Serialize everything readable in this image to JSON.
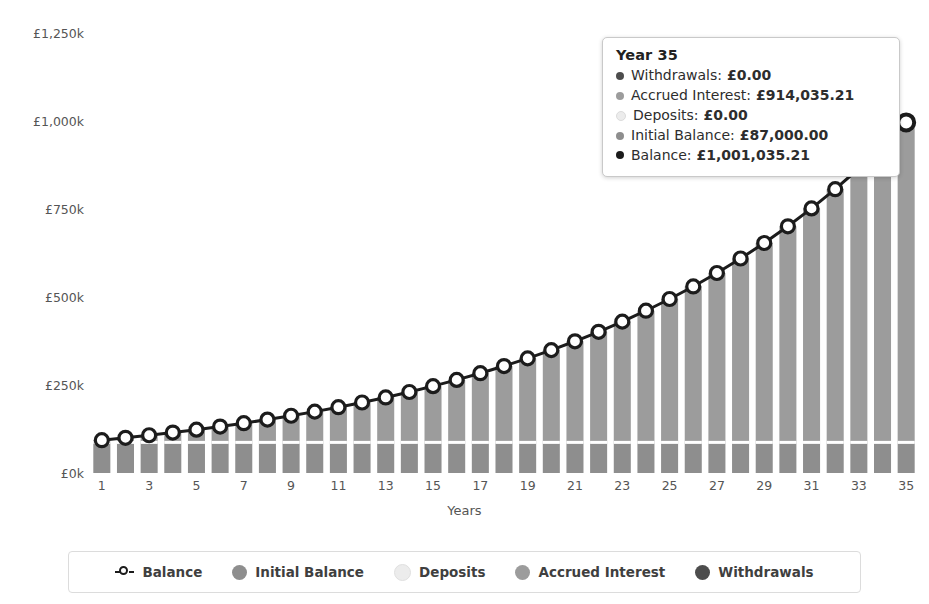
{
  "title": "",
  "chart_data": {
    "type": "bar",
    "subtype": "stacked-bar-with-line-overlay",
    "title": "",
    "xlabel": "Years",
    "ylabel": "",
    "xtick_step": 2,
    "grid": false,
    "legend_position": "bottom",
    "ylim": [
      0,
      1250000
    ],
    "ytick_values": [
      0,
      250000,
      500000,
      750000,
      1000000,
      1250000
    ],
    "ytick_labels": [
      "£0k",
      "£250k",
      "£500k",
      "£750k",
      "£1,000k",
      "£1,250k"
    ],
    "categories": [
      1,
      2,
      3,
      4,
      5,
      6,
      7,
      8,
      9,
      10,
      11,
      12,
      13,
      14,
      15,
      16,
      17,
      18,
      19,
      20,
      21,
      22,
      23,
      24,
      25,
      26,
      27,
      28,
      29,
      30,
      31,
      32,
      33,
      34,
      35
    ],
    "xtick_labels": [
      "1",
      "3",
      "5",
      "7",
      "9",
      "11",
      "13",
      "15",
      "17",
      "19",
      "21",
      "23",
      "25",
      "27",
      "29",
      "31",
      "33",
      "35"
    ],
    "series": [
      {
        "name": "Initial Balance",
        "kind": "bar",
        "color": "#8e8e8e",
        "values": [
          87000,
          87000,
          87000,
          87000,
          87000,
          87000,
          87000,
          87000,
          87000,
          87000,
          87000,
          87000,
          87000,
          87000,
          87000,
          87000,
          87000,
          87000,
          87000,
          87000,
          87000,
          87000,
          87000,
          87000,
          87000,
          87000,
          87000,
          87000,
          87000,
          87000,
          87000,
          87000,
          87000,
          87000,
          87000
        ]
      },
      {
        "name": "Deposits",
        "kind": "bar",
        "color": "#ececec",
        "values": [
          0,
          0,
          0,
          0,
          0,
          0,
          0,
          0,
          0,
          0,
          0,
          0,
          0,
          0,
          0,
          0,
          0,
          0,
          0,
          0,
          0,
          0,
          0,
          0,
          0,
          0,
          0,
          0,
          0,
          0,
          0,
          0,
          0,
          0,
          0
        ]
      },
      {
        "name": "Accrued Interest",
        "kind": "bar",
        "color": "#9c9c9c",
        "values": [
          6264,
          12978,
          20174,
          27888,
          36156,
          45019,
          54520,
          64703,
          75620,
          87321,
          99865,
          113309,
          127719,
          143163,
          159714,
          177453,
          196464,
          216841,
          238685,
          262103,
          287214,
          314143,
          343027,
          374012,
          407257,
          442930,
          481217,
          522313,
          566434,
          613809,
          664687,
          719337,
          778048,
          841136,
          908938
        ]
      },
      {
        "name": "Withdrawals",
        "kind": "bar",
        "color": "#4d4d4d",
        "values": [
          0,
          0,
          0,
          0,
          0,
          0,
          0,
          0,
          0,
          0,
          0,
          0,
          0,
          0,
          0,
          0,
          0,
          0,
          0,
          0,
          0,
          0,
          0,
          0,
          0,
          0,
          0,
          0,
          0,
          0,
          0,
          0,
          0,
          0,
          0
        ]
      },
      {
        "name": "Balance",
        "kind": "line",
        "color": "#1c1c1c",
        "marker": "open-circle",
        "values": [
          93264,
          99978,
          107174,
          114888,
          123156,
          132019,
          141520,
          151703,
          162620,
          174321,
          186865,
          200309,
          214719,
          230163,
          246714,
          264453,
          283464,
          303841,
          325685,
          349103,
          374214,
          401143,
          430027,
          461012,
          494257,
          529930,
          568217,
          609313,
          653434,
          700809,
          751687,
          806337,
          865048,
          928136,
          995938
        ]
      }
    ],
    "annotation_point": {
      "x": 35,
      "y": 1001035.21
    }
  },
  "yaxis": {
    "ticks": [
      {
        "label": "£1,250k",
        "value": 1250000
      },
      {
        "label": "£1,000k",
        "value": 1000000
      },
      {
        "label": "£750k",
        "value": 750000
      },
      {
        "label": "£500k",
        "value": 500000
      },
      {
        "label": "£250k",
        "value": 250000
      },
      {
        "label": "£0k",
        "value": 0
      }
    ]
  },
  "xaxis": {
    "title": "Years",
    "ticks": [
      "1",
      "3",
      "5",
      "7",
      "9",
      "11",
      "13",
      "15",
      "17",
      "19",
      "21",
      "23",
      "25",
      "27",
      "29",
      "31",
      "33",
      "35"
    ]
  },
  "tooltip": {
    "title": "Year 35",
    "rows": [
      {
        "name": "Withdrawals:",
        "value": "£0.00",
        "color": "#4d4d4d"
      },
      {
        "name": "Accrued Interest:",
        "value": "£914,035.21",
        "color": "#9c9c9c"
      },
      {
        "name": "Deposits:",
        "value": "£0.00",
        "color": "#ececec"
      },
      {
        "name": "Initial Balance:",
        "value": "£87,000.00",
        "color": "#8e8e8e"
      },
      {
        "name": "Balance:",
        "value": "£1,001,035.21",
        "color": "#1c1c1c"
      }
    ]
  },
  "legend": {
    "items": [
      {
        "label": "Balance",
        "color": "#1c1c1c",
        "marker": "open-circle"
      },
      {
        "label": "Initial Balance",
        "color": "#8e8e8e",
        "marker": "dot"
      },
      {
        "label": "Deposits",
        "color": "#ececec",
        "marker": "dot"
      },
      {
        "label": "Accrued Interest",
        "color": "#9c9c9c",
        "marker": "dot"
      },
      {
        "label": "Withdrawals",
        "color": "#4d4d4d",
        "marker": "dot"
      }
    ]
  },
  "colors": {
    "initial_balance": "#8e8e8e",
    "deposits": "#ececec",
    "accrued_interest": "#9c9c9c",
    "withdrawals": "#4d4d4d",
    "balance_line": "#1c1c1c",
    "background": "#ffffff",
    "axis_text": "#555555"
  }
}
